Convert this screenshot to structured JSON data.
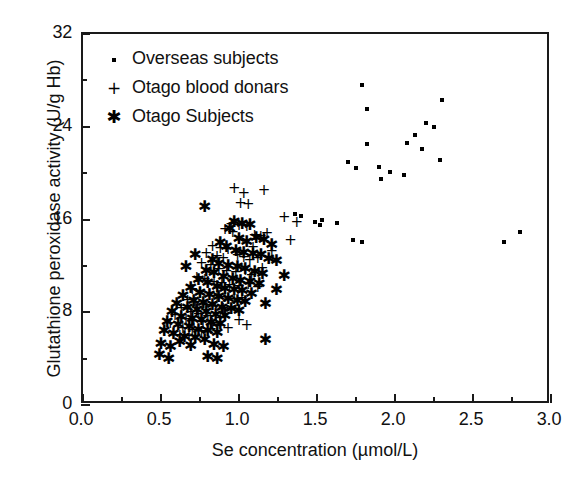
{
  "chart_data": {
    "type": "scatter",
    "title": "",
    "xlabel": "Se concentration (µmol/L)",
    "ylabel": "Glutathione peroxidase activity (U/g Hb)",
    "xlim": [
      0.0,
      3.0
    ],
    "ylim": [
      0,
      32
    ],
    "xticks": [
      "0.0",
      "0.5",
      "1.0",
      "1.5",
      "2.0",
      "2.5",
      "3.0"
    ],
    "xtick_values": [
      0.0,
      0.5,
      1.0,
      1.5,
      2.0,
      2.5,
      3.0
    ],
    "x_minor_step": 0.25,
    "yticks": [
      "0",
      "8",
      "16",
      "24",
      "32"
    ],
    "ytick_values": [
      0,
      8,
      16,
      24,
      32
    ],
    "y_minor_step": 4,
    "grid": false,
    "legend_position": "top-left",
    "series": [
      {
        "name": "Overseas subjects",
        "marker": "dot",
        "points": [
          [
            1.79,
            27.6
          ],
          [
            2.3,
            26.3
          ],
          [
            1.82,
            25.5
          ],
          [
            2.13,
            23.3
          ],
          [
            2.17,
            22.1
          ],
          [
            2.2,
            24.3
          ],
          [
            2.25,
            24.0
          ],
          [
            2.29,
            21.1
          ],
          [
            2.08,
            22.6
          ],
          [
            1.9,
            20.5
          ],
          [
            1.82,
            22.5
          ],
          [
            1.7,
            21.0
          ],
          [
            1.75,
            20.4
          ],
          [
            2.06,
            19.8
          ],
          [
            1.91,
            19.5
          ],
          [
            1.97,
            20.1
          ],
          [
            1.53,
            16.0
          ],
          [
            1.49,
            15.8
          ],
          [
            1.63,
            15.7
          ],
          [
            1.73,
            14.2
          ],
          [
            1.79,
            14.1
          ],
          [
            2.7,
            14.1
          ],
          [
            2.8,
            14.9
          ],
          [
            1.52,
            15.5
          ],
          [
            1.36,
            16.5
          ],
          [
            1.4,
            16.3
          ]
        ]
      },
      {
        "name": "Otago blood donars",
        "marker": "plus",
        "points": [
          [
            0.97,
            18.7
          ],
          [
            1.03,
            18.2
          ],
          [
            1.16,
            18.5
          ],
          [
            1.01,
            17.4
          ],
          [
            1.06,
            17.3
          ],
          [
            1.29,
            16.2
          ],
          [
            1.37,
            15.7
          ],
          [
            1.33,
            14.2
          ],
          [
            0.95,
            15.6
          ],
          [
            1.0,
            15.5
          ],
          [
            1.05,
            15.4
          ],
          [
            0.91,
            15.1
          ],
          [
            0.96,
            14.9
          ],
          [
            1.1,
            14.6
          ],
          [
            1.14,
            14.5
          ],
          [
            1.18,
            14.8
          ],
          [
            0.83,
            13.7
          ],
          [
            0.88,
            13.5
          ],
          [
            0.93,
            13.4
          ],
          [
            0.79,
            13.1
          ],
          [
            0.86,
            12.8
          ],
          [
            0.9,
            12.6
          ],
          [
            0.99,
            12.9
          ],
          [
            1.03,
            12.7
          ],
          [
            1.07,
            12.5
          ],
          [
            1.12,
            12.6
          ],
          [
            1.21,
            13.2
          ],
          [
            1.09,
            13.6
          ],
          [
            0.76,
            12.2
          ],
          [
            0.82,
            12.0
          ],
          [
            0.87,
            11.7
          ],
          [
            0.92,
            11.5
          ],
          [
            0.98,
            11.4
          ],
          [
            1.04,
            11.6
          ],
          [
            1.08,
            11.2
          ],
          [
            1.15,
            11.8
          ],
          [
            0.73,
            11.0
          ],
          [
            0.78,
            10.8
          ],
          [
            0.84,
            10.6
          ],
          [
            0.89,
            10.5
          ],
          [
            0.94,
            10.3
          ],
          [
            1.0,
            10.2
          ],
          [
            1.06,
            10.4
          ],
          [
            1.12,
            10.1
          ],
          [
            0.7,
            10.0
          ],
          [
            0.75,
            9.7
          ],
          [
            0.81,
            9.6
          ],
          [
            0.86,
            9.4
          ],
          [
            0.91,
            9.3
          ],
          [
            0.97,
            9.1
          ],
          [
            1.02,
            9.2
          ],
          [
            0.67,
            9.0
          ],
          [
            0.72,
            8.8
          ],
          [
            0.79,
            8.6
          ],
          [
            0.85,
            8.5
          ],
          [
            0.9,
            8.3
          ],
          [
            0.95,
            8.2
          ],
          [
            0.63,
            8.3
          ],
          [
            0.69,
            8.0
          ],
          [
            0.74,
            7.8
          ],
          [
            0.8,
            7.6
          ],
          [
            0.88,
            7.5
          ],
          [
            0.59,
            7.7
          ],
          [
            0.66,
            7.4
          ],
          [
            0.71,
            7.2
          ],
          [
            0.77,
            7.1
          ],
          [
            0.83,
            7.0
          ],
          [
            0.56,
            7.0
          ],
          [
            0.64,
            6.6
          ],
          [
            0.7,
            6.4
          ],
          [
            0.76,
            6.3
          ],
          [
            0.82,
            6.5
          ],
          [
            0.62,
            6.0
          ],
          [
            0.68,
            5.9
          ],
          [
            0.86,
            6.8
          ],
          [
            0.93,
            6.6
          ],
          [
            1.0,
            7.3
          ],
          [
            1.05,
            6.9
          ]
        ]
      },
      {
        "name": "Otago Subjects",
        "marker": "star",
        "points": [
          [
            0.78,
            17.1
          ],
          [
            0.97,
            15.8
          ],
          [
            1.02,
            15.6
          ],
          [
            1.07,
            15.5
          ],
          [
            0.94,
            15.2
          ],
          [
            1.0,
            14.3
          ],
          [
            1.05,
            14.1
          ],
          [
            1.11,
            14.4
          ],
          [
            1.16,
            14.2
          ],
          [
            1.21,
            13.8
          ],
          [
            0.88,
            14.0
          ],
          [
            0.92,
            13.6
          ],
          [
            0.98,
            13.3
          ],
          [
            1.03,
            13.1
          ],
          [
            1.09,
            13.0
          ],
          [
            1.14,
            12.9
          ],
          [
            1.19,
            12.6
          ],
          [
            1.24,
            12.4
          ],
          [
            0.83,
            12.5
          ],
          [
            0.87,
            12.2
          ],
          [
            0.93,
            12.0
          ],
          [
            0.99,
            11.9
          ],
          [
            1.04,
            11.7
          ],
          [
            1.1,
            11.5
          ],
          [
            1.15,
            11.3
          ],
          [
            0.79,
            11.6
          ],
          [
            0.84,
            11.4
          ],
          [
            0.9,
            11.0
          ],
          [
            0.96,
            10.9
          ],
          [
            1.01,
            10.7
          ],
          [
            1.07,
            10.6
          ],
          [
            1.13,
            10.4
          ],
          [
            0.74,
            10.8
          ],
          [
            0.8,
            10.5
          ],
          [
            0.86,
            10.2
          ],
          [
            0.91,
            10.0
          ],
          [
            0.97,
            9.9
          ],
          [
            1.02,
            9.8
          ],
          [
            1.08,
            9.6
          ],
          [
            0.69,
            10.1
          ],
          [
            0.75,
            9.7
          ],
          [
            0.81,
            9.5
          ],
          [
            0.87,
            9.3
          ],
          [
            0.93,
            9.1
          ],
          [
            0.99,
            9.0
          ],
          [
            1.04,
            8.9
          ],
          [
            0.64,
            9.4
          ],
          [
            0.71,
            9.0
          ],
          [
            0.77,
            8.8
          ],
          [
            0.83,
            8.6
          ],
          [
            0.89,
            8.4
          ],
          [
            0.95,
            8.3
          ],
          [
            1.0,
            8.1
          ],
          [
            0.6,
            8.7
          ],
          [
            0.67,
            8.4
          ],
          [
            0.73,
            8.2
          ],
          [
            0.79,
            8.0
          ],
          [
            0.85,
            7.8
          ],
          [
            0.91,
            7.7
          ],
          [
            0.57,
            8.0
          ],
          [
            0.63,
            7.6
          ],
          [
            0.7,
            7.4
          ],
          [
            0.76,
            7.3
          ],
          [
            0.82,
            7.1
          ],
          [
            0.88,
            7.0
          ],
          [
            0.54,
            7.2
          ],
          [
            0.61,
            6.9
          ],
          [
            0.68,
            6.7
          ],
          [
            0.74,
            6.5
          ],
          [
            0.8,
            6.4
          ],
          [
            0.86,
            6.2
          ],
          [
            0.52,
            6.4
          ],
          [
            0.58,
            6.1
          ],
          [
            0.65,
            5.9
          ],
          [
            0.72,
            5.8
          ],
          [
            0.78,
            5.6
          ],
          [
            0.5,
            5.3
          ],
          [
            0.56,
            5.0
          ],
          [
            0.62,
            5.4
          ],
          [
            0.69,
            5.1
          ],
          [
            0.84,
            5.2
          ],
          [
            0.9,
            5.0
          ],
          [
            0.49,
            4.3
          ],
          [
            0.55,
            4.0
          ],
          [
            0.8,
            4.1
          ],
          [
            0.86,
            4.0
          ],
          [
            1.17,
            8.7
          ],
          [
            1.17,
            5.6
          ],
          [
            1.24,
            9.9
          ],
          [
            1.29,
            11.1
          ],
          [
            0.66,
            11.9
          ],
          [
            0.72,
            12.9
          ]
        ]
      }
    ]
  },
  "legend": {
    "items": [
      {
        "symbol": "·",
        "marker": "dot",
        "label": "Overseas subjects"
      },
      {
        "symbol": "+",
        "marker": "plus",
        "label": "Otago blood donars"
      },
      {
        "symbol": "✱",
        "marker": "star",
        "label": "Otago Subjects"
      }
    ]
  },
  "axes": {
    "x_title": "Se concentration (µmol/L)",
    "y_title": "Glutathione peroxidase activity (U/g Hb)"
  },
  "colors": {
    "marker": "#000000",
    "axis": "#1a1a1a",
    "background": "#ffffff"
  }
}
